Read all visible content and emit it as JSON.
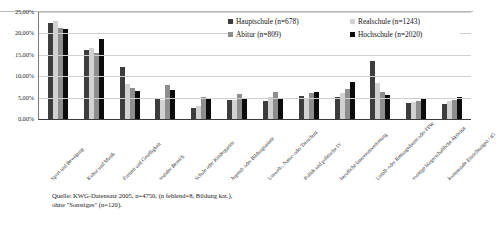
{
  "chart_data": {
    "type": "bar",
    "title": "",
    "xlabel": "",
    "ylabel": "",
    "ylim": [
      0,
      25
    ],
    "grid": true,
    "legend_position": "top-right",
    "y_ticks": [
      "0,00%",
      "5,00%",
      "10,00%",
      "15,00%",
      "20,00%",
      "25,00%"
    ],
    "y_tick_values": [
      0,
      5,
      10,
      15,
      20,
      25
    ],
    "categories": [
      "Sport und Bewegung",
      "Kultur und Musik",
      "Freizeit und Geselligkeit",
      "sozialer Bereich",
      "Schule oder Kindergarten",
      "Jugend- oder Bildungsarbeit",
      "Umwelt-, Natur- oder Tierschutz",
      "Politik und politische IV",
      "berufliche Interessenvertretung",
      "Unfall- oder Rettungsdienst oder FFW",
      "sonstige bürgerschaftliche Aktivität",
      "kommunale Einrichtungen / IG"
    ],
    "series": [
      {
        "name": "Hauptschule (n=678)",
        "color": "#3d3d3d",
        "values": [
          22.5,
          16.2,
          12.1,
          4.9,
          2.5,
          4.5,
          4.2,
          5.3,
          5.1,
          13.5,
          3.8,
          3.6
        ]
      },
      {
        "name": "Realschule (n=1243)",
        "color": "#d2d2d2",
        "values": [
          23.0,
          16.7,
          8.1,
          4.5,
          3.1,
          4.4,
          5.2,
          4.6,
          6.1,
          8.3,
          4.0,
          4.3
        ]
      },
      {
        "name": "Abitur (n=809)",
        "color": "#8e8e8e",
        "values": [
          21.3,
          15.4,
          7.2,
          7.9,
          5.2,
          5.8,
          6.2,
          6.0,
          7.0,
          6.4,
          4.1,
          4.5
        ]
      },
      {
        "name": "Hochschule (n=2020)",
        "color": "#0c0c0c",
        "values": [
          21.0,
          18.7,
          6.5,
          6.8,
          4.7,
          4.8,
          5.0,
          6.3,
          8.6,
          5.6,
          4.6,
          5.1
        ]
      }
    ],
    "source_note": "Quelle: KWG-Datensatz 2005, n=4750, (n fehlend=8, Bildung kat.),\nohne \"Sonstiges\" (n=120)."
  },
  "legend": {
    "items": [
      {
        "label": "Hauptschule (n=678)",
        "color": "#3d3d3d"
      },
      {
        "label": "Realschule (n=1243)",
        "color": "#d2d2d2"
      },
      {
        "label": "Abitur (n=809)",
        "color": "#8e8e8e"
      },
      {
        "label": "Hochschule (n=2020)",
        "color": "#0c0c0c"
      }
    ]
  }
}
